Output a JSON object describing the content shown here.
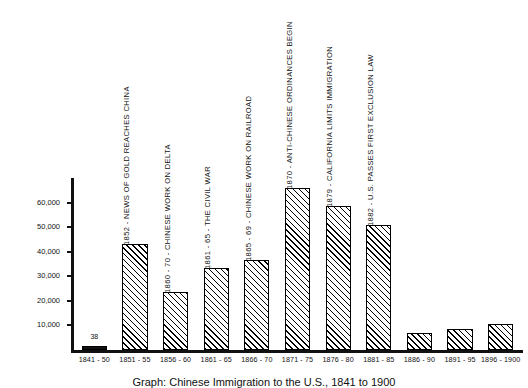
{
  "caption": "Graph: Chinese Immigration to the U.S., 1841 to 1900",
  "chart_data": {
    "type": "bar",
    "title": "Graph: Chinese Immigration to the U.S., 1841 to 1900",
    "xlabel": "",
    "ylabel": "",
    "ylim": [
      0,
      70000
    ],
    "grid": false,
    "legend": "none",
    "yticks": [
      "10,000",
      "20,000",
      "30,000",
      "40,000",
      "50,000",
      "60,000"
    ],
    "ytick_values": [
      10000,
      20000,
      30000,
      40000,
      50000,
      60000
    ],
    "categories": [
      "1841 - 50",
      "1851 - 55",
      "1856 - 60",
      "1861 - 65",
      "1866 - 70",
      "1871 - 75",
      "1876 - 80",
      "1881 - 85",
      "1886 - 90",
      "1891 - 95",
      "1896 - 1900"
    ],
    "values": [
      38,
      43000,
      23500,
      33500,
      36500,
      66000,
      58500,
      51000,
      7000,
      8500,
      10500
    ],
    "data_labels": [
      {
        "index": 0,
        "text": "38"
      }
    ],
    "annotations": [
      {
        "index": 1,
        "text": "1852 - NEWS OF GOLD REACHES CHINA"
      },
      {
        "index": 2,
        "text": "1860 - 70 - CHINESE WORK ON DELTA"
      },
      {
        "index": 3,
        "text": "1861 - 65 - THE CIVIL WAR"
      },
      {
        "index": 4,
        "text": "1865 - 69 - CHINESE WORK ON RAILROAD"
      },
      {
        "index": 5,
        "text": "1870 - ANTI-CHINESE ORDINANCES BEGIN"
      },
      {
        "index": 6,
        "text": "1879 - CALIFORNIA LIMITS IMMIGRATION"
      },
      {
        "index": 7,
        "text": "1882 - U.S. PASSES FIRST EXCLUSION LAW"
      }
    ]
  },
  "colors": {
    "ink": "#111111",
    "background": "#ffffff",
    "bar_fill": "#ffffff",
    "bar_hatch": "#000000"
  }
}
